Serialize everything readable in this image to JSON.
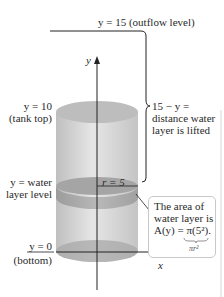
{
  "figure": {
    "outflow_label": "y = 15 (outflow level)",
    "tank_top_label": {
      "line1": "y = 10",
      "line2": "(tank top)"
    },
    "water_level_label": {
      "line1": "y = water",
      "line2": "layer level"
    },
    "bottom_label": {
      "line1": "y = 0",
      "line2": "(bottom)"
    },
    "distance_label": {
      "line1": "15 − y =",
      "line2": "distance water",
      "line3": "layer is lifted"
    },
    "radius_label": "r = 5",
    "area_box": {
      "line1": "The area of",
      "line2": "water layer is",
      "line3": "A(y) = π(5²).",
      "underbrace": "πr²"
    },
    "axes": {
      "y_label": "y",
      "x_label": "x"
    },
    "colors": {
      "cylinder_body": "#d9d9d9",
      "cylinder_top": "#bdbdbd",
      "water_layer": "#a9a9a9",
      "lines": "#222222",
      "box_border": "#c9c9c9"
    }
  }
}
